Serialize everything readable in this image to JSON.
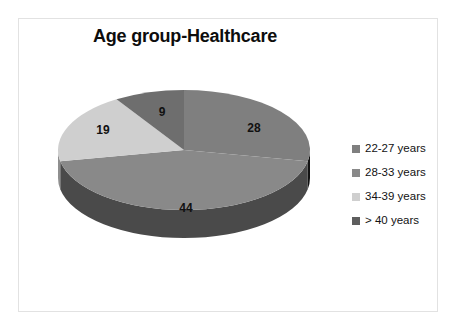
{
  "chart_data": {
    "type": "pie",
    "title": "Age group-Healthcare",
    "xlabel": "",
    "ylabel": "",
    "categories": [
      "22-27 years",
      "28-33 years",
      "34-39 years",
      "> 40 years"
    ],
    "values": [
      28,
      44,
      19,
      9
    ],
    "labels": [
      "28",
      "44",
      "19",
      "9"
    ],
    "legend_position": "right",
    "grid": false,
    "three_d": true,
    "start_angle_deg": 0,
    "direction": "clockwise",
    "colors": [
      "#7f7f7f",
      "#898989",
      "#cfcfcf",
      "#6e6e6e"
    ],
    "side_colors": [
      "#121212",
      "#4a4a4a",
      "#8f8f8f",
      "#3d3d3d"
    ],
    "slices": [
      {
        "name": "22-27 years",
        "value": 28,
        "label": "28",
        "color": "#7f7f7f"
      },
      {
        "name": "28-33 years",
        "value": 44,
        "label": "44",
        "color": "#898989"
      },
      {
        "name": "34-39 years",
        "value": 19,
        "label": "19",
        "color": "#cfcfcf"
      },
      {
        "name": "> 40 years",
        "value": 9,
        "label": "9",
        "color": "#6e6e6e"
      }
    ]
  },
  "legend": {
    "items": [
      {
        "label": "22-27 years",
        "color": "#7f7f7f"
      },
      {
        "label": "28-33 years",
        "color": "#898989"
      },
      {
        "label": "34-39 years",
        "color": "#cfcfcf"
      },
      {
        "label": "> 40 years",
        "color": "#5e5e5e"
      }
    ]
  },
  "frame": {
    "border_color": "#e2e2e2",
    "background": "#ffffff"
  }
}
